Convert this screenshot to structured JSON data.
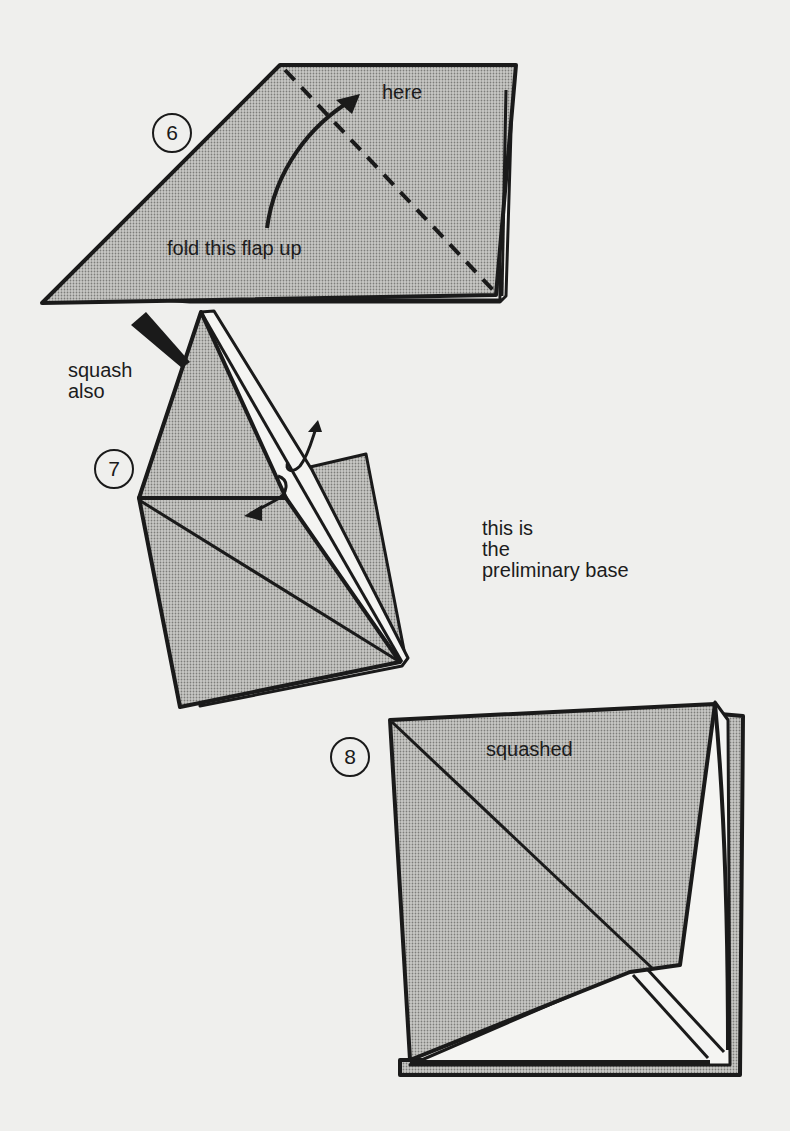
{
  "colors": {
    "background": "#efefed",
    "paper_shaded": "#b9b9b6",
    "paper_white": "#f4f4f2",
    "ink": "#1a1a1a"
  },
  "steps": [
    {
      "number": "6",
      "labels": {
        "target": "here",
        "instruction": "fold this flap up"
      },
      "icons": [
        "dashed-fold-line",
        "curved-fold-arrow"
      ]
    },
    {
      "number": "7",
      "labels": {
        "action": "squash\nalso",
        "note": "this is\nthe\npreliminary base"
      },
      "icons": [
        "push-arrow",
        "unfold-arrow",
        "squash-arrow"
      ]
    },
    {
      "number": "8",
      "labels": {
        "result": "squashed"
      }
    }
  ]
}
